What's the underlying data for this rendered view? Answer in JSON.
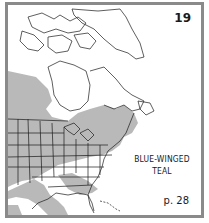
{
  "map": {
    "plate_number": "19",
    "species_name_line1": "BLUE-WINGED",
    "species_name_line2": "TEAL",
    "page_reference": "p. 28",
    "region": "North America (eastern and central)",
    "colors": {
      "range_fill": "#b9b9b9",
      "land_fill": "#ffffff",
      "outline": "#1a1a1a",
      "frame_border": "#8a8a8a"
    }
  }
}
